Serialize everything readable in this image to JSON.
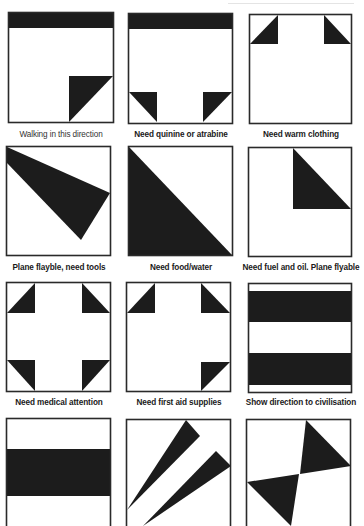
{
  "figure": {
    "colors": {
      "fill": "#1c1c1c",
      "stroke": "#2a2a2a",
      "background": "#ffffff"
    },
    "panels": [
      {
        "id": "p1",
        "label": "Walking in this direction",
        "bold": false,
        "box": [
          8,
          12,
          106,
          111
        ],
        "shapes": [
          [
            [
              8,
              12
            ],
            [
              114,
              12
            ],
            [
              114,
              28
            ],
            [
              8,
              28
            ]
          ],
          [
            [
              69,
              76
            ],
            [
              113,
              76
            ],
            [
              69,
              122
            ]
          ]
        ]
      },
      {
        "id": "p2",
        "label": "Need quinine or atrabine",
        "bold": true,
        "box": [
          128,
          13,
          105,
          111
        ],
        "shapes": [
          [
            [
              128,
              13
            ],
            [
              233,
              13
            ],
            [
              233,
              29
            ],
            [
              128,
              29
            ]
          ],
          [
            [
              129,
              92
            ],
            [
              157,
              92
            ],
            [
              157,
              122
            ]
          ],
          [
            [
              203,
              92
            ],
            [
              232,
              92
            ],
            [
              203,
              122
            ]
          ]
        ]
      },
      {
        "id": "p3",
        "label": "Need warm clothing",
        "bold": true,
        "box": [
          249,
          14,
          103,
          110
        ],
        "shapes": [
          [
            [
              250,
              44
            ],
            [
              278,
              44
            ],
            [
              278,
              15
            ]
          ],
          [
            [
              324,
              15
            ],
            [
              324,
              44
            ],
            [
              351,
              44
            ]
          ]
        ]
      },
      {
        "id": "p4",
        "label": "Plane flayble, need tools",
        "bold": true,
        "box": [
          6,
          146,
          105,
          110
        ],
        "shapes": [
          [
            [
              7,
              147
            ],
            [
              110,
              193
            ],
            [
              81,
              240
            ],
            [
              7,
              163
            ]
          ]
        ]
      },
      {
        "id": "p5",
        "label": "Need food/water",
        "bold": true,
        "box": [
          128,
          146,
          105,
          110
        ],
        "shapes": [
          [
            [
              129,
              147
            ],
            [
              129,
              255
            ],
            [
              232,
              255
            ]
          ]
        ]
      },
      {
        "id": "p6",
        "label": "Need fuel and oil. Plane flyable",
        "bold": true,
        "box": [
          248,
          147,
          104,
          110
        ],
        "shapes": [
          [
            [
              293,
              148
            ],
            [
              293,
              209
            ],
            [
              351,
              209
            ]
          ]
        ]
      },
      {
        "id": "p7",
        "label": "Need medical attention",
        "bold": true,
        "box": [
          6,
          282,
          105,
          110
        ],
        "shapes": [
          [
            [
              7,
              313
            ],
            [
              35,
              313
            ],
            [
              35,
              283
            ]
          ],
          [
            [
              82,
              283
            ],
            [
              82,
              313
            ],
            [
              110,
              313
            ]
          ],
          [
            [
              7,
              360
            ],
            [
              35,
              360
            ],
            [
              35,
              391
            ]
          ],
          [
            [
              82,
              391
            ],
            [
              82,
              360
            ],
            [
              110,
              360
            ]
          ]
        ]
      },
      {
        "id": "p8",
        "label": "Need first aid supplies",
        "bold": true,
        "box": [
          126,
          282,
          105,
          110
        ],
        "shapes": [
          [
            [
              127,
              313
            ],
            [
              155,
              313
            ],
            [
              155,
              283
            ]
          ],
          [
            [
              201,
              283
            ],
            [
              201,
              313
            ],
            [
              230,
              313
            ]
          ],
          [
            [
              201,
              391
            ],
            [
              201,
              362
            ],
            [
              230,
              362
            ]
          ]
        ]
      },
      {
        "id": "p9",
        "label": "Show direction to civilisation",
        "bold": true,
        "box": [
          248,
          283,
          104,
          110
        ],
        "shapes": [
          [
            [
              249,
              291
            ],
            [
              351,
              291
            ],
            [
              351,
              322
            ],
            [
              249,
              322
            ]
          ],
          [
            [
              249,
              353
            ],
            [
              351,
              353
            ],
            [
              351,
              385
            ],
            [
              249,
              385
            ]
          ]
        ]
      },
      {
        "id": "p10",
        "label": "",
        "bold": true,
        "box": [
          6,
          418,
          105,
          120
        ],
        "shapes": [
          [
            [
              7,
              449
            ],
            [
              110,
              449
            ],
            [
              110,
              496
            ],
            [
              7,
              496
            ]
          ]
        ]
      },
      {
        "id": "p11",
        "label": "",
        "bold": true,
        "box": [
          126,
          419,
          105,
          120
        ],
        "shapes": [
          [
            [
              127,
              510
            ],
            [
              186,
              420
            ],
            [
              200,
              436
            ]
          ],
          [
            [
              143,
              526
            ],
            [
              216,
              451
            ],
            [
              231,
              466
            ]
          ]
        ]
      },
      {
        "id": "p12",
        "label": "",
        "bold": true,
        "box": [
          246,
          419,
          105,
          120
        ],
        "shapes": [
          [
            [
              306,
              420
            ],
            [
              351,
              466
            ],
            [
              300,
              474
            ]
          ],
          [
            [
              247,
              482
            ],
            [
              299,
              474
            ],
            [
              291,
              526
            ]
          ]
        ]
      }
    ],
    "label_positions": [
      {
        "x": -4,
        "y": 130
      },
      {
        "x": 116,
        "y": 130
      },
      {
        "x": 236,
        "y": 130
      },
      {
        "x": -6,
        "y": 263
      },
      {
        "x": 116,
        "y": 263
      },
      {
        "x": 236,
        "y": 263
      },
      {
        "x": -6,
        "y": 398
      },
      {
        "x": 114,
        "y": 398
      },
      {
        "x": 236,
        "y": 398
      }
    ]
  }
}
